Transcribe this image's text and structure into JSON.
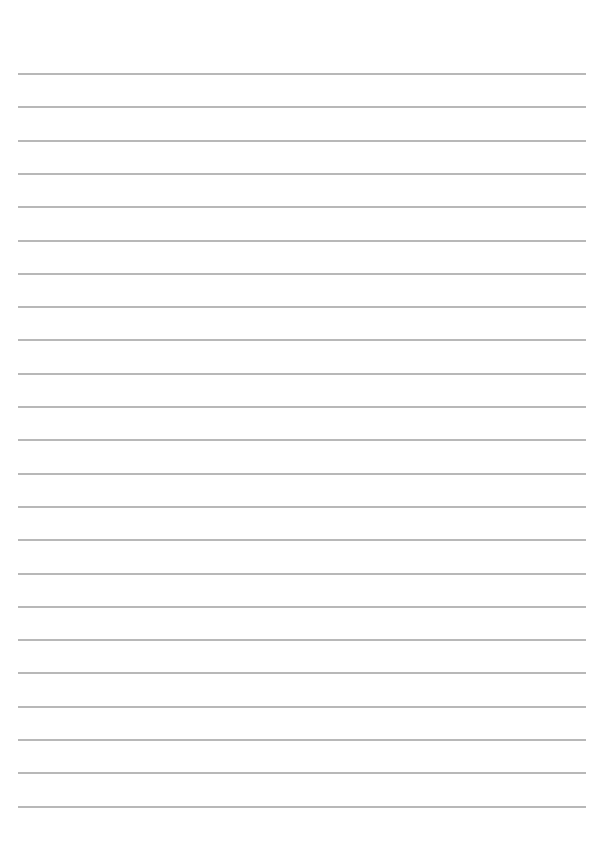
{
  "page": {
    "type": "lined-paper",
    "background": "#ffffff",
    "line_color": "#b8b8b8",
    "line_count": 23,
    "first_line_y": 73,
    "line_spacing": 33.3,
    "left": 18,
    "right": 586
  }
}
